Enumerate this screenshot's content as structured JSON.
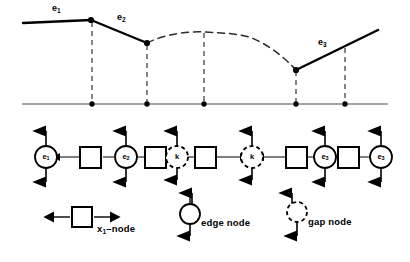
{
  "figure": {
    "title_visible": false,
    "colors": {
      "ink": "#000000",
      "baseline": "#555555",
      "dashed": "#333333"
    }
  },
  "plot": {
    "name": "upper-profile-plot",
    "baseline": {
      "x1": 22,
      "x2": 388,
      "y": 104
    },
    "baseline_points_x": [
      92,
      147,
      204,
      296,
      345
    ],
    "solid_segments": [
      {
        "label": "e1",
        "points": [
          [
            23,
            23
          ],
          [
            91,
            20
          ]
        ]
      },
      {
        "label": "e2",
        "points": [
          [
            91,
            20
          ],
          [
            147,
            43
          ]
        ]
      },
      {
        "label": "e3",
        "points": [
          [
            296,
            70
          ],
          [
            378,
            30
          ]
        ]
      }
    ],
    "dashed_curve": [
      [
        147,
        43
      ],
      [
        175,
        34
      ],
      [
        205,
        32
      ],
      [
        232,
        33
      ],
      [
        252,
        37
      ],
      [
        272,
        46
      ],
      [
        296,
        70
      ]
    ],
    "vertices_x": [
      91,
      147,
      296
    ],
    "drop_lines_x": [
      92,
      147,
      204,
      296,
      345
    ],
    "labels": [
      {
        "text": "e",
        "subscript": "1",
        "x": 52,
        "y": 7,
        "name": "plot-label-e1"
      },
      {
        "text": "e",
        "subscript": "2",
        "x": 117,
        "y": 15,
        "name": "plot-label-e2"
      },
      {
        "text": "e",
        "subscript": "3",
        "x": 319,
        "y": 40,
        "name": "plot-label-e3"
      }
    ]
  },
  "chain": {
    "name": "node-chain",
    "y": 157,
    "nodes": [
      {
        "kind": "circle",
        "label": "e",
        "subscript": "1",
        "x": 46,
        "name": "edge-node-e1"
      },
      {
        "kind": "square",
        "label": "",
        "subscript": "",
        "x": 91,
        "name": "x1-node-1"
      },
      {
        "kind": "circle",
        "label": "e",
        "subscript": "2",
        "x": 126,
        "name": "edge-node-e2"
      },
      {
        "kind": "square",
        "label": "",
        "subscript": "",
        "x": 155,
        "name": "x1-node-2"
      },
      {
        "kind": "dashed-circle",
        "label": "k",
        "subscript": "",
        "x": 177,
        "name": "gap-node-k1"
      },
      {
        "kind": "square",
        "label": "",
        "subscript": "",
        "x": 205,
        "name": "x1-node-3"
      },
      {
        "kind": "dashed-circle",
        "label": "k",
        "subscript": "",
        "x": 252,
        "name": "gap-node-k2"
      },
      {
        "kind": "square",
        "label": "",
        "subscript": "",
        "x": 296,
        "name": "x1-node-4"
      },
      {
        "kind": "circle",
        "label": "e",
        "subscript": "3",
        "x": 325,
        "name": "edge-node-e3-a"
      },
      {
        "kind": "square",
        "label": "",
        "subscript": "",
        "x": 348,
        "name": "x1-node-5"
      },
      {
        "kind": "circle",
        "label": "e",
        "subscript": "3",
        "x": 381,
        "name": "edge-node-e3-b"
      }
    ],
    "connectors": [
      {
        "x1": 60,
        "x2": 80,
        "arrow": "left",
        "name": "connector-1"
      },
      {
        "x1": 103,
        "x2": 113,
        "arrow": "none",
        "name": "connector-2"
      },
      {
        "x1": 139,
        "x2": 144,
        "arrow": "none",
        "name": "connector-3"
      },
      {
        "x1": 167,
        "x2": 166,
        "arrow": "none",
        "name": "connector-4"
      },
      {
        "x1": 189,
        "x2": 194,
        "arrow": "none",
        "name": "connector-5"
      },
      {
        "x1": 216,
        "x2": 240,
        "arrow": "right",
        "name": "connector-6"
      },
      {
        "x1": 264,
        "x2": 285,
        "arrow": "left",
        "name": "connector-7"
      },
      {
        "x1": 307,
        "x2": 312,
        "arrow": "none",
        "name": "connector-8"
      },
      {
        "x1": 338,
        "x2": 337,
        "arrow": "none",
        "name": "connector-9"
      },
      {
        "x1": 359,
        "x2": 369,
        "arrow": "right",
        "name": "connector-10"
      }
    ],
    "arrow_columns_x": [
      46,
      126,
      177,
      252,
      325,
      381
    ],
    "long_down_arrows_x": [
      177,
      252
    ]
  },
  "legend": {
    "name": "legend",
    "items": [
      {
        "glyph": "square",
        "label": "x",
        "subscript": "1",
        "suffix": "–node",
        "x": 82,
        "y": 217,
        "name": "legend-x1-node"
      },
      {
        "glyph": "circle",
        "label": "edge node",
        "subscript": "",
        "suffix": "",
        "x": 190,
        "y": 214,
        "name": "legend-edge-node"
      },
      {
        "glyph": "dashed-circle",
        "label": "gap node",
        "subscript": "",
        "suffix": "",
        "x": 297,
        "y": 212,
        "name": "legend-gap-node"
      }
    ]
  }
}
